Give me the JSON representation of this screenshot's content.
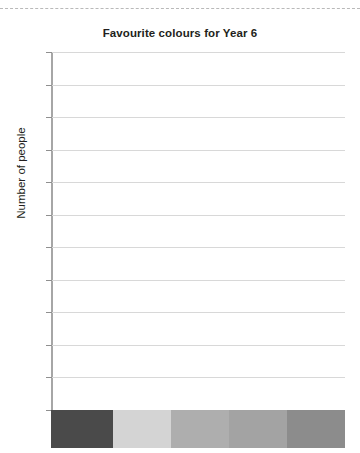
{
  "page": {
    "cut_line": "dashed-cut-line"
  },
  "chart_data": {
    "type": "bar",
    "title": "Favourite colours for Year 6",
    "xlabel": "",
    "ylabel": "Number of people",
    "categories": [
      "",
      "",
      "",
      "",
      ""
    ],
    "values": [
      0,
      0,
      0,
      0,
      0
    ],
    "ylim": [
      0,
      11
    ],
    "ytick_values": [
      0,
      1,
      2,
      3,
      4,
      5,
      6,
      7,
      8,
      9,
      10,
      11
    ],
    "ytick_labels": [
      "0",
      "",
      "",
      "",
      "",
      "",
      "",
      "",
      "",
      "",
      "",
      ""
    ],
    "grid": true,
    "legend": "none",
    "bar_colors": [
      "#4a4a4a",
      "#d4d4d4",
      "#aeaeae",
      "#a3a3a3",
      "#8c8c8c"
    ],
    "note": "Empty bar chart template: axis drawn, no bars plotted; five colour swatches shown below the baseline."
  },
  "axis": {
    "zero_label": "0"
  },
  "swatches": [
    {
      "name": "swatch-1",
      "color": "#4a4a4a",
      "width_pct": 21.1
    },
    {
      "name": "swatch-2",
      "color": "#d4d4d4",
      "width_pct": 19.7
    },
    {
      "name": "swatch-3",
      "color": "#aeaeae",
      "width_pct": 19.7
    },
    {
      "name": "swatch-4",
      "color": "#a3a3a3",
      "width_pct": 19.7
    },
    {
      "name": "swatch-5",
      "color": "#8c8c8c",
      "width_pct": 19.8
    }
  ]
}
